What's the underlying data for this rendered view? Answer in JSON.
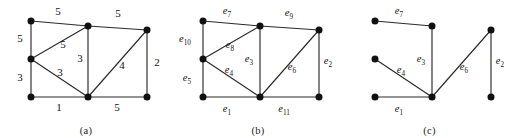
{
  "figure": {
    "width": 515,
    "height": 138,
    "background": "#ffffff",
    "ink_color": "#111111",
    "edge_color": "#2b2b2b"
  },
  "vertices": {
    "V1": {
      "x": 31,
      "y": 21,
      "role": "top-left"
    },
    "V2": {
      "x": 31,
      "y": 59,
      "role": "left-middle"
    },
    "V3": {
      "x": 31,
      "y": 97,
      "role": "bottom-left"
    },
    "V4": {
      "x": 88,
      "y": 26,
      "role": "middle-top"
    },
    "V5": {
      "x": 88,
      "y": 97,
      "role": "middle-bottom"
    },
    "V6": {
      "x": 147,
      "y": 30,
      "role": "top-right"
    },
    "V7": {
      "x": 147,
      "y": 97,
      "role": "bottom-right"
    }
  },
  "panels": [
    {
      "id": "a",
      "caption": "(a)",
      "caption_x": 88,
      "description": "weighted graph",
      "edges": [
        {
          "from": "V1",
          "to": "V4",
          "label": "5",
          "lx": 58,
          "ly": 15
        },
        {
          "from": "V4",
          "to": "V6",
          "label": "5",
          "lx": 118,
          "ly": 17
        },
        {
          "from": "V1",
          "to": "V2",
          "label": "5",
          "lx": 20,
          "ly": 42
        },
        {
          "from": "V2",
          "to": "V4",
          "label": "5",
          "lx": 63,
          "ly": 48
        },
        {
          "from": "V4",
          "to": "V5",
          "label": "3",
          "lx": 80,
          "ly": 62
        },
        {
          "from": "V2",
          "to": "V3",
          "label": "3",
          "lx": 20,
          "ly": 81
        },
        {
          "from": "V2",
          "to": "V5",
          "label": "3",
          "lx": 60,
          "ly": 76
        },
        {
          "from": "V3",
          "to": "V5",
          "label": "1",
          "lx": 59,
          "ly": 111
        },
        {
          "from": "V5",
          "to": "V7",
          "label": "5",
          "lx": 117,
          "ly": 111
        },
        {
          "from": "V5",
          "to": "V6",
          "label": "4",
          "lx": 122,
          "ly": 69
        },
        {
          "from": "V6",
          "to": "V7",
          "label": "2",
          "lx": 157,
          "ly": 66
        }
      ]
    },
    {
      "id": "b",
      "caption": "(b)",
      "caption_x": 88,
      "description": "same graph with edge names",
      "edges": [
        {
          "from": "V1",
          "to": "V4",
          "label": "e",
          "sub": "7",
          "lx": 55,
          "ly": 14
        },
        {
          "from": "V4",
          "to": "V6",
          "label": "e",
          "sub": "9",
          "lx": 117,
          "ly": 16
        },
        {
          "from": "V1",
          "to": "V2",
          "label": "e",
          "sub": "10",
          "lx": 13,
          "ly": 42
        },
        {
          "from": "V2",
          "to": "V4",
          "label": "e",
          "sub": "8",
          "lx": 58,
          "ly": 48
        },
        {
          "from": "V4",
          "to": "V5",
          "label": "e",
          "sub": "3",
          "lx": 77,
          "ly": 62
        },
        {
          "from": "V2",
          "to": "V3",
          "label": "e",
          "sub": "5",
          "lx": 15,
          "ly": 81
        },
        {
          "from": "V2",
          "to": "V5",
          "label": "e",
          "sub": "4",
          "lx": 57,
          "ly": 73
        },
        {
          "from": "V3",
          "to": "V5",
          "label": "e",
          "sub": "1",
          "lx": 55,
          "ly": 112
        },
        {
          "from": "V5",
          "to": "V7",
          "label": "e",
          "sub": "11",
          "lx": 112,
          "ly": 112
        },
        {
          "from": "V5",
          "to": "V6",
          "label": "e",
          "sub": "6",
          "lx": 120,
          "ly": 70
        },
        {
          "from": "V6",
          "to": "V7",
          "label": "e",
          "sub": "2",
          "lx": 156,
          "ly": 64
        }
      ]
    },
    {
      "id": "c",
      "caption": "(c)",
      "caption_x": 80,
      "description": "spanning forest subgraph",
      "edges": [
        {
          "from": "V1",
          "to": "V4",
          "label": "e",
          "sub": "7",
          "lx": 55,
          "ly": 14
        },
        {
          "from": "V4",
          "to": "V5",
          "label": "e",
          "sub": "3",
          "lx": 77,
          "ly": 62
        },
        {
          "from": "V2",
          "to": "V5",
          "label": "e",
          "sub": "4",
          "lx": 57,
          "ly": 73
        },
        {
          "from": "V3",
          "to": "V5",
          "label": "e",
          "sub": "1",
          "lx": 55,
          "ly": 112
        },
        {
          "from": "V5",
          "to": "V6",
          "label": "e",
          "sub": "6",
          "lx": 120,
          "ly": 70
        },
        {
          "from": "V6",
          "to": "V7",
          "label": "e",
          "sub": "2",
          "lx": 156,
          "ly": 64
        }
      ]
    }
  ]
}
